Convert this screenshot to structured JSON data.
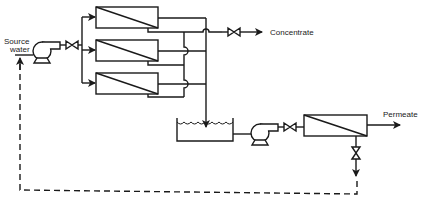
{
  "diagram": {
    "type": "process-flow",
    "labels": {
      "source_line1": "Source",
      "source_line2": "water",
      "concentrate": "Concentrate",
      "permeate": "Permeate"
    },
    "nodes": [
      {
        "id": "feed-pump",
        "kind": "pump"
      },
      {
        "id": "feed-valve",
        "kind": "valve"
      },
      {
        "id": "membrane-1",
        "kind": "membrane-module"
      },
      {
        "id": "membrane-2",
        "kind": "membrane-module"
      },
      {
        "id": "membrane-3",
        "kind": "membrane-module"
      },
      {
        "id": "concentrate-valve",
        "kind": "valve"
      },
      {
        "id": "tank",
        "kind": "tank"
      },
      {
        "id": "second-pump",
        "kind": "pump"
      },
      {
        "id": "second-valve",
        "kind": "valve"
      },
      {
        "id": "second-membrane",
        "kind": "membrane-module"
      },
      {
        "id": "drain-valve",
        "kind": "valve"
      }
    ],
    "edges": [
      {
        "from": "source",
        "to": "feed-pump"
      },
      {
        "from": "feed-pump",
        "to": "feed-valve"
      },
      {
        "from": "feed-valve",
        "to": "membrane-1"
      },
      {
        "from": "feed-valve",
        "to": "membrane-2"
      },
      {
        "from": "feed-valve",
        "to": "membrane-3"
      },
      {
        "from": "membranes (retentate)",
        "to": "concentrate-valve"
      },
      {
        "from": "concentrate-valve",
        "to": "Concentrate"
      },
      {
        "from": "membranes (permeate)",
        "to": "tank"
      },
      {
        "from": "tank",
        "to": "second-pump"
      },
      {
        "from": "second-pump",
        "to": "second-valve"
      },
      {
        "from": "second-valve",
        "to": "second-membrane"
      },
      {
        "from": "second-membrane",
        "to": "Permeate"
      },
      {
        "from": "second-membrane",
        "to": "drain-valve"
      },
      {
        "from": "drain-valve",
        "to": "source (recycle, dashed)"
      }
    ],
    "colors": {
      "line": "#1a1a1a",
      "background": "#ffffff"
    }
  }
}
